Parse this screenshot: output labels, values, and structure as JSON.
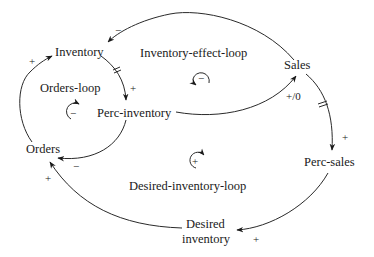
{
  "nodes": {
    "inventory": "Inventory",
    "sales": "Sales",
    "perc_inventory": "Perc-inventory",
    "orders": "Orders",
    "perc_sales": "Perc-sales",
    "desired_inventory_line1": "Desired",
    "desired_inventory_line2": "inventory"
  },
  "loops": {
    "inventory_effect": {
      "label": "Inventory-effect-loop",
      "polarity": "−",
      "direction": "counterclockwise"
    },
    "orders": {
      "label": "Orders-loop",
      "polarity": "−",
      "direction": "clockwise"
    },
    "desired_inventory": {
      "label": "Desired-inventory-loop",
      "polarity": "+",
      "direction": "clockwise"
    }
  },
  "edges": [
    {
      "from": "Sales",
      "to": "Inventory",
      "polarity": "−",
      "delay": false
    },
    {
      "from": "Inventory",
      "to": "Perc-inventory",
      "polarity": "+",
      "delay": true
    },
    {
      "from": "Perc-inventory",
      "to": "Sales",
      "polarity": "+/0",
      "delay": false
    },
    {
      "from": "Perc-inventory",
      "to": "Orders",
      "polarity": "−",
      "delay": false
    },
    {
      "from": "Orders",
      "to": "Inventory",
      "polarity": "+",
      "delay": false
    },
    {
      "from": "Sales",
      "to": "Perc-sales",
      "polarity": "+",
      "delay": true
    },
    {
      "from": "Perc-sales",
      "to": "Desired inventory",
      "polarity": "+",
      "delay": false
    },
    {
      "from": "Desired inventory",
      "to": "Orders",
      "polarity": "+",
      "delay": false
    }
  ],
  "polarity_labels": {
    "sales_to_inventory": "−",
    "inventory_to_perc_inventory": "+",
    "perc_inventory_to_sales": "+/0",
    "perc_inventory_to_orders": "−",
    "orders_to_inventory": "+",
    "sales_to_perc_sales": "+",
    "perc_sales_to_desired_inventory": "+",
    "desired_inventory_to_orders": "+"
  }
}
